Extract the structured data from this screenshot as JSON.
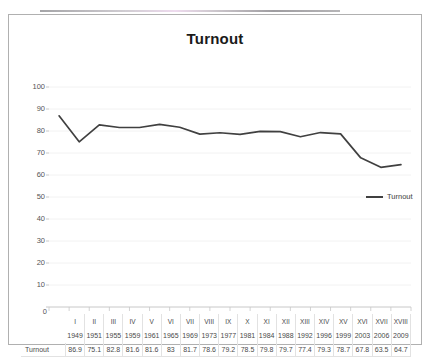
{
  "chart_data": {
    "type": "line",
    "title": "Turnout",
    "xlabel": "",
    "ylabel": "",
    "ylim": [
      0,
      100
    ],
    "ytick_step": 10,
    "yticks": [
      100,
      90,
      80,
      70,
      60,
      50,
      40,
      30,
      20,
      10,
      0
    ],
    "grid": true,
    "legend_position": "right",
    "categories": [
      "I",
      "II",
      "III",
      "IV",
      "V",
      "VI",
      "VII",
      "VIII",
      "IX",
      "X",
      "XI",
      "XII",
      "XIII",
      "XIV",
      "XV",
      "XVI",
      "XVII",
      "XVIII"
    ],
    "years": [
      "1949",
      "1951",
      "1955",
      "1959",
      "1961",
      "1965",
      "1969",
      "1973",
      "1977",
      "1981",
      "1984",
      "1988",
      "1992",
      "1996",
      "1999",
      "2003",
      "2006",
      "2009"
    ],
    "series": [
      {
        "name": "Turnout",
        "color": "#404040",
        "values": [
          86.9,
          75.1,
          82.8,
          81.6,
          81.6,
          83,
          81.7,
          78.6,
          79.2,
          78.5,
          79.8,
          79.7,
          77.4,
          79.3,
          78.7,
          67.8,
          63.5,
          64.7
        ],
        "labels": [
          "86.9",
          "75.1",
          "82.8",
          "81.6",
          "81.6",
          "83",
          "81.7",
          "78.6",
          "79.2",
          "78.5",
          "79.8",
          "79.7",
          "77.4",
          "79.3",
          "78.7",
          "67.8",
          "63.5",
          "64.7"
        ]
      }
    ]
  },
  "legend": {
    "entries": [
      {
        "label": "Turnout"
      }
    ]
  },
  "table": {
    "row_label": "Turnout"
  },
  "axis": {
    "zero_label": "0"
  },
  "colors": {
    "line": "#404040",
    "grid": "#f2f2f2",
    "frame": "#b0b0b0",
    "text": "#4a4a4a"
  }
}
